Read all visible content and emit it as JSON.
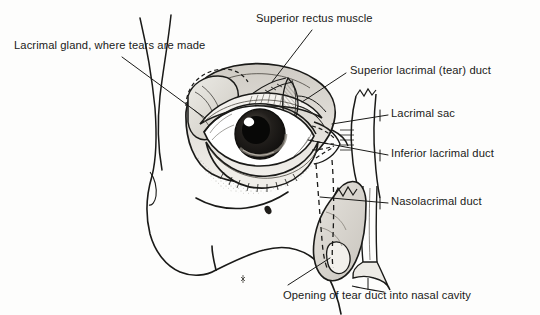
{
  "figure": {
    "kind": "anatomical-illustration",
    "style": "black-and-white pen-and-ink engraving",
    "background_color": "#fdfdfc",
    "ink_color": "#1a1a18"
  },
  "labels": {
    "lacrimal_gland": "Lacrimal gland, where tears are made",
    "superior_rectus": "Superior rectus muscle",
    "superior_lacrimal_duct": "Superior lacrimal (tear) duct",
    "lacrimal_sac": "Lacrimal sac",
    "inferior_lacrimal_duct": "Inferior lacrimal duct",
    "nasolacrimal_duct": "Nasolacrimal duct",
    "opening_nasal_cavity": "Opening of tear duct into nasal cavity"
  },
  "parts": {
    "eyeball": "eyeball",
    "iris": "iris",
    "pupil": "pupil",
    "highlight": "corneal-highlight",
    "upper_eyelid": "upper-eyelid",
    "lower_eyelid": "lower-eyelid",
    "eyelashes": "eyelashes",
    "orbit_rim": "orbital-rim",
    "brow_contour": "brow-and-temple-contour",
    "cheek_contour": "cheek-and-maxilla-contour",
    "nasal_bone": "nasal-bone",
    "canaliculi": "lacrimal-canaliculi"
  }
}
